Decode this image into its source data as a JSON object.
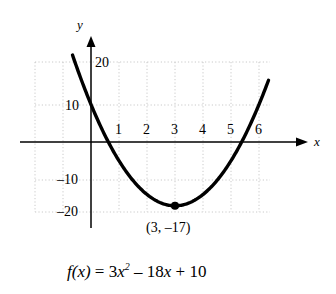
{
  "chart_data": {
    "type": "line",
    "title": "",
    "function_label": "f(x) = 3x² – 18x + 10",
    "equation": {
      "lhs": "f",
      "lhs_arg": "(x)",
      "eq": "=",
      "term1_coef": "3",
      "term1_var": "x",
      "term1_exp": "2",
      "term2": "– 18",
      "term2_var": "x",
      "term3": "+ 10"
    },
    "coefficients": {
      "a": 3,
      "b": -18,
      "c": 10
    },
    "xlabel": "x",
    "ylabel": "y",
    "xlim": [
      -2.0,
      6.4
    ],
    "ylim": [
      -21.3,
      21.3
    ],
    "x_ticks": [
      "1",
      "2",
      "3",
      "4",
      "5",
      "6"
    ],
    "x_tick_values": [
      1,
      2,
      3,
      4,
      5,
      6
    ],
    "y_ticks": [
      "20",
      "10",
      "–10",
      "–20"
    ],
    "y_tick_values": [
      20,
      10,
      -10,
      -20
    ],
    "grid": true,
    "grid_style": "dotted",
    "legend": "none",
    "annotations": [
      {
        "name": "vertex",
        "text": "(3, –17)",
        "x": 3,
        "y": -17,
        "marker": "filled-circle"
      }
    ],
    "roots_approx": [
      0.61,
      5.39
    ],
    "y_intercept": 10,
    "series": [
      {
        "name": "f(x) = 3x^2 - 18x + 10",
        "x": [
          -0.65,
          -0.4,
          -0.1,
          0.2,
          0.5,
          0.8,
          1.1,
          1.4,
          1.7,
          2.0,
          2.3,
          2.6,
          2.9,
          3.0,
          3.2,
          3.5,
          3.8,
          4.1,
          4.4,
          4.7,
          5.0,
          5.3,
          5.6,
          5.9,
          6.2,
          6.4
        ],
        "y": [
          23.0,
          17.7,
          11.8,
          6.5,
          1.75,
          -2.48,
          -4.37,
          -7.32,
          -11.53,
          -14.0,
          -15.53,
          -16.58,
          -17.0,
          -17.0,
          -16.88,
          -16.25,
          -14.48,
          -12.37,
          -11.53,
          -7.33,
          -5.0,
          -1.55,
          2.08,
          8.57,
          13.92,
          17.72
        ]
      }
    ]
  },
  "figure": {
    "background_color": "#ffffff",
    "curve_color": "#000000",
    "axis_color": "#000000",
    "grid_color": "#bbbbbb"
  }
}
